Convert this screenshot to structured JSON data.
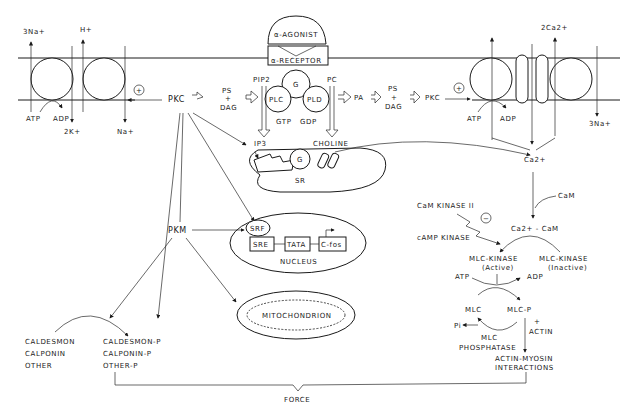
{
  "diagram": {
    "membrane": {
      "left_pumps": {
        "na_k_pump": {
          "out": "3Na+",
          "in": "2K+",
          "atp": "ATP",
          "adp": "ADP"
        },
        "na_h_exchanger": {
          "out": "H+",
          "in": "Na+"
        }
      },
      "receptor": {
        "agonist": "α-AGONIST",
        "receptor": "α-RECEPTOR"
      },
      "g_protein": {
        "g": "G",
        "plc": "PLC",
        "pld": "PLD",
        "gtp": "GTP",
        "gdp": "GDP",
        "pip2": "PIP2",
        "pc": "PC",
        "ip3": "IP3",
        "choline": "CHOLINE"
      },
      "right_pumps": {
        "ca_atpase": {
          "atp": "ATP",
          "adp": "ADP"
        },
        "na_ca_exchanger": {
          "out": "2Ca2+",
          "in": "3Na+"
        }
      },
      "plus_sign": "+"
    },
    "left_pathway": {
      "ps": "PS",
      "plus": "+",
      "dag": "DAG",
      "pkc": "PKC"
    },
    "right_pathway": {
      "pa": "PA",
      "ps": "PS",
      "plus": "+",
      "dag": "DAG",
      "pkc": "PKC"
    },
    "sr": {
      "label": "SR",
      "g": "G"
    },
    "nucleus": {
      "label": "NUCLEUS",
      "srf": "SRF",
      "sre": "SRE",
      "tata": "TATA",
      "cfos": "C-fos"
    },
    "mitochondrion": {
      "label": "MITOCHONDRION"
    },
    "pkm": "PKM",
    "calcium": {
      "ca": "Ca2+",
      "cam": "CaM",
      "ca_cam": "Ca2+ - CaM",
      "cam_kinase": "CaM KINASE II",
      "camp_kinase": "cAMP KINASE",
      "minus": "−"
    },
    "mlc_kinase": {
      "active": "MLC-KINASE",
      "active_sub": "(Active)",
      "inactive": "MLC-KINASE",
      "inactive_sub": "(Inactive)"
    },
    "mlc_cycle": {
      "atp": "ATP",
      "adp": "ADP",
      "mlc": "MLC",
      "mlc_p": "MLC-P",
      "pi": "Pi",
      "phosphatase_1": "MLC",
      "phosphatase_2": "PHOSPHATASE",
      "plus": "+",
      "actin": "ACTIN"
    },
    "actin_myosin": {
      "line1": "ACTIN-MYOSIN",
      "line2": "INTERACTIONS"
    },
    "thin_filament": {
      "unphos": [
        "CALDESMON",
        "CALPONIN",
        "OTHER"
      ],
      "phos": [
        "CALDESMON-P",
        "CALPONIN-P",
        "OTHER-P"
      ]
    },
    "output": "FORCE"
  }
}
